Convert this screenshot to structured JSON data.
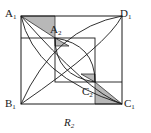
{
  "figure": {
    "caption": "R",
    "caption_sub": "2",
    "stroke_color": "#1a1a1a",
    "shade_color": "#b8b8b8",
    "background_color": "#ffffff"
  },
  "labels": [
    {
      "name": "label-a1",
      "text": "A",
      "sub": "1",
      "x": 5,
      "y": 8
    },
    {
      "name": "label-d1",
      "text": "D",
      "sub": "1",
      "x": 120,
      "y": 8
    },
    {
      "name": "label-b1",
      "text": "B",
      "sub": "1",
      "x": 5,
      "y": 98
    },
    {
      "name": "label-c1",
      "text": "C",
      "sub": "1",
      "x": 124,
      "y": 98
    },
    {
      "name": "label-a2",
      "text": "A",
      "sub": "2",
      "x": 50,
      "y": 24
    },
    {
      "name": "label-c2",
      "text": "C",
      "sub": "2",
      "x": 82,
      "y": 86
    }
  ],
  "geometry": {
    "outer_square": {
      "x1": 21,
      "y1": 16,
      "x2": 122,
      "y2": 104
    },
    "inner_square": {
      "x1": 55,
      "y1": 38,
      "x2": 95,
      "y2": 82
    },
    "point_a2": {
      "x": 55,
      "y": 38
    },
    "point_c2": {
      "x": 95,
      "y": 82
    },
    "shaded_triangle_top_left": "21,16 55,16 55,38",
    "shaded_triangle_bottom_right": "122,104 95,104 95,82",
    "shaded_triangle_inner_upper": "55,46 69,46 55,38",
    "shaded_triangle_inner_lower": "95,74 81,74 95,82",
    "horizontal_line_left": {
      "x1": 21,
      "y1": 38,
      "x2": 55,
      "y2": 38
    },
    "horizontal_line_right": {
      "x1": 95,
      "y1": 82,
      "x2": 122,
      "y2": 82
    }
  }
}
